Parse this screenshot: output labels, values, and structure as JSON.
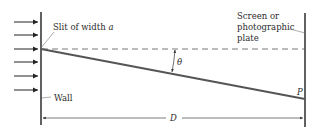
{
  "diagram": {
    "labels": {
      "slit": "Slit of width ",
      "slit_var": "a",
      "screen_line1": "Screen or",
      "screen_line2": "photographic",
      "screen_line3": "plate",
      "wall": "Wall",
      "angle": "θ",
      "point": "P",
      "distance": "D"
    },
    "colors": {
      "line": "#3a3a3a",
      "ray": "#555555",
      "dashed": "#6a6a6a",
      "text": "#2b2b2b"
    },
    "incident_arrows": 6
  }
}
